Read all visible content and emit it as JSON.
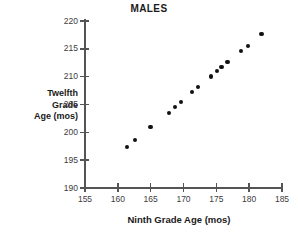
{
  "chart_data": {
    "type": "scatter",
    "title": "MALES",
    "xlabel": "Ninth Grade Age (mos)",
    "ylabel": "Twelfth Grade Age (mos)",
    "ylabel_lines": [
      "Twelfth",
      "Grade",
      "Age (mos)"
    ],
    "xlim": [
      155,
      185
    ],
    "ylim": [
      190,
      220
    ],
    "xticks": [
      155,
      160,
      165,
      170,
      175,
      180,
      185
    ],
    "yticks": [
      190,
      195,
      200,
      205,
      210,
      215,
      220
    ],
    "grid": false,
    "legend": null,
    "marker": "filled-circle",
    "marker_color": "#111111",
    "axis_color": "#555555",
    "points": [
      {
        "x": 161.4,
        "y": 197.4
      },
      {
        "x": 162.6,
        "y": 198.6
      },
      {
        "x": 165.0,
        "y": 201.0
      },
      {
        "x": 167.8,
        "y": 203.5
      },
      {
        "x": 168.7,
        "y": 204.5
      },
      {
        "x": 169.6,
        "y": 205.4
      },
      {
        "x": 171.3,
        "y": 207.3
      },
      {
        "x": 172.2,
        "y": 208.1
      },
      {
        "x": 174.2,
        "y": 210.0
      },
      {
        "x": 175.1,
        "y": 211.0
      },
      {
        "x": 175.8,
        "y": 211.7
      },
      {
        "x": 176.7,
        "y": 212.6
      },
      {
        "x": 178.8,
        "y": 214.6
      },
      {
        "x": 179.8,
        "y": 215.5
      },
      {
        "x": 181.9,
        "y": 217.7
      }
    ]
  }
}
